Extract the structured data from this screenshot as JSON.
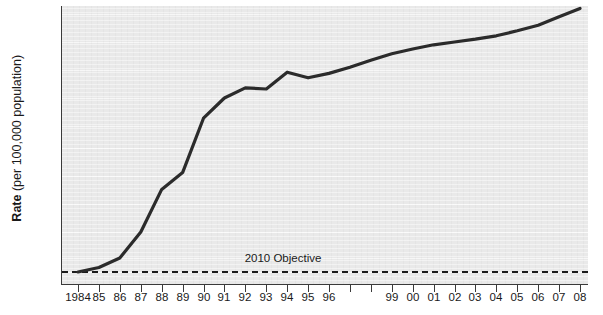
{
  "chart_data": {
    "type": "line",
    "title": "",
    "xlabel": "",
    "ylabel": "Rate (per 100,000 population)",
    "ylabel_bold_prefix": "Rate",
    "ylabel_rest": " (per 100,000 population)",
    "grid": true,
    "legend_position": "none",
    "x": [
      "1984",
      "85",
      "86",
      "87",
      "88",
      "89",
      "90",
      "91",
      "92",
      "93",
      "94",
      "95",
      "96",
      "97",
      "98",
      "99",
      "00",
      "01",
      "02",
      "03",
      "04",
      "05",
      "06",
      "07",
      "08"
    ],
    "x_tick_labels": [
      "1984",
      "85",
      "86",
      "87",
      "88",
      "89",
      "90",
      "91",
      "92",
      "93",
      "94",
      "95",
      "96",
      "",
      "",
      "99",
      "00",
      "01",
      "02",
      "03",
      "04",
      "05",
      "06",
      "07",
      "08"
    ],
    "y_tick_labels": [
      "0",
      "3",
      "25",
      "50",
      "75",
      "100",
      "125",
      "150",
      "175",
      "200",
      "300",
      "400"
    ],
    "y_tick_values": [
      0,
      3,
      25,
      50,
      75,
      100,
      125,
      150,
      175,
      200,
      300,
      400
    ],
    "ylim": [
      0,
      430
    ],
    "series": [
      {
        "name": "Rate",
        "color": "#2b2b2b",
        "values": [
          3,
          10,
          25,
          50,
          88,
          103,
          157,
          175,
          184,
          183,
          198,
          193,
          197,
          210,
          235,
          258,
          275,
          290,
          300,
          310,
          322,
          340,
          360,
          390,
          420
        ]
      }
    ],
    "annotations": [
      {
        "name": "2010-objective",
        "label": "2010 Objective",
        "type": "horizontal-reference-line",
        "value": 3,
        "style": "dashed",
        "color": "#1a1a1a",
        "label_x": "93.5"
      }
    ],
    "colors": {
      "plot_background": "#e9e9e9",
      "gridline": "#f7f7f7",
      "axis": "#3a3a3a",
      "series_line": "#2b2b2b",
      "objective_line": "#1a1a1a",
      "text": "#1a1a1a"
    }
  }
}
